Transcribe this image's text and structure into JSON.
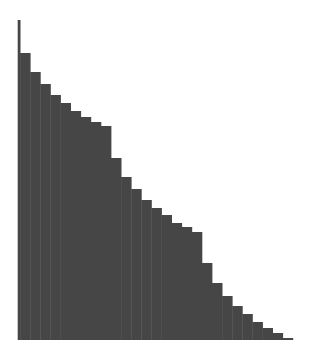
{
  "chart_data": {
    "type": "bar",
    "title": "",
    "xlabel": "",
    "ylabel": "",
    "grid": false,
    "legend": null,
    "bar_color": "#464646",
    "categories": [
      "1",
      "2",
      "3",
      "4",
      "5",
      "6",
      "7",
      "8",
      "9",
      "10",
      "11",
      "12",
      "13",
      "14",
      "15",
      "16",
      "17",
      "18",
      "19",
      "20",
      "21",
      "22",
      "23",
      "24",
      "25",
      "26",
      "27",
      "28"
    ],
    "values": [
      320,
      287,
      268,
      256,
      245,
      237,
      229,
      223,
      218,
      214,
      182,
      163,
      151,
      140,
      132,
      125,
      117,
      113,
      108,
      77,
      57,
      44,
      34,
      26,
      18,
      12,
      7,
      2
    ],
    "ylim": [
      0,
      320
    ]
  },
  "layout": {
    "plot_left": 17.7,
    "plot_baseline": 340,
    "first_bar_width": 2.4,
    "bar_width": 10.1,
    "pixels_per_unit": 1
  }
}
